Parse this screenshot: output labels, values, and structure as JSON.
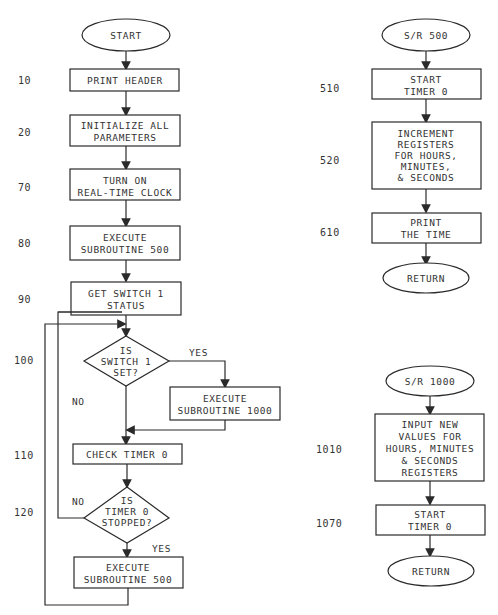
{
  "main_flow": {
    "start": "START",
    "steps": [
      {
        "line": "10",
        "text": [
          "PRINT HEADER"
        ]
      },
      {
        "line": "20",
        "text": [
          "INITIALIZE ALL",
          "PARAMETERS"
        ]
      },
      {
        "line": "70",
        "text": [
          "TURN ON",
          "REAL-TIME CLOCK"
        ]
      },
      {
        "line": "80",
        "text": [
          "EXECUTE",
          "SUBROUTINE 500"
        ]
      },
      {
        "line": "90",
        "text": [
          "GET SWITCH 1",
          "STATUS"
        ]
      }
    ],
    "decision_switch": {
      "line": "100",
      "text": [
        "IS",
        "SWITCH 1",
        "SET?"
      ],
      "yes": "YES",
      "no": "NO"
    },
    "execute_1000": {
      "text": [
        "EXECUTE",
        "SUBROUTINE 1000"
      ]
    },
    "check_timer": {
      "line": "110",
      "text": [
        "CHECK TIMER 0"
      ]
    },
    "decision_timer": {
      "line": "120",
      "text": [
        "IS",
        "TIMER 0",
        "STOPPED?"
      ],
      "yes": "YES",
      "no": "NO"
    },
    "execute_500": {
      "text": [
        "EXECUTE",
        "SUBROUTINE 500"
      ]
    }
  },
  "sr500": {
    "start": "S/R 500",
    "steps": [
      {
        "line": "510",
        "text": [
          "START",
          "TIMER 0"
        ]
      },
      {
        "line": "520",
        "text": [
          "INCREMENT",
          "REGISTERS",
          "FOR HOURS,",
          "MINUTES,",
          "& SECONDS"
        ]
      },
      {
        "line": "610",
        "text": [
          "PRINT",
          "THE TIME"
        ]
      }
    ],
    "end": "RETURN"
  },
  "sr1000": {
    "start": "S/R 1000",
    "steps": [
      {
        "line": "1010",
        "text": [
          "INPUT NEW",
          "VALUES FOR",
          "HOURS, MINUTES",
          "& SECONDS",
          "REGISTERS"
        ]
      },
      {
        "line": "1070",
        "text": [
          "START",
          "TIMER 0"
        ]
      }
    ],
    "end": "RETURN"
  }
}
